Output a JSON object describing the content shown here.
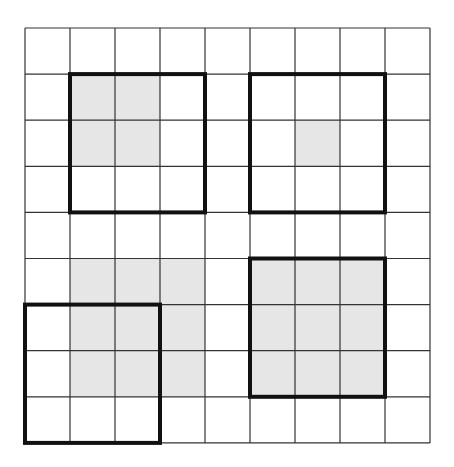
{
  "diagram": {
    "title": "",
    "grid": {
      "rows": 9,
      "cols": 9,
      "origin_x": 25,
      "origin_y": 28,
      "cell_w": 45,
      "cell_h": 46.1,
      "line_color": "#333333",
      "line_width": 1.2
    },
    "colors": {
      "background": "#ffffff",
      "shade": "#e6e6e6",
      "bold_border": "#111111"
    },
    "shaded_cells": [
      [
        1,
        1
      ],
      [
        1,
        2
      ],
      [
        2,
        1
      ],
      [
        2,
        2
      ],
      [
        2,
        6
      ],
      [
        5,
        1
      ],
      [
        5,
        2
      ],
      [
        5,
        3
      ],
      [
        6,
        1
      ],
      [
        6,
        2
      ],
      [
        6,
        3
      ],
      [
        7,
        1
      ],
      [
        7,
        2
      ],
      [
        7,
        3
      ],
      [
        5,
        5
      ],
      [
        5,
        6
      ],
      [
        5,
        7
      ],
      [
        6,
        5
      ],
      [
        6,
        6
      ],
      [
        6,
        7
      ],
      [
        7,
        5
      ],
      [
        7,
        6
      ],
      [
        7,
        7
      ]
    ],
    "bold_squares": [
      {
        "name": "top-left-square",
        "row": 1,
        "col": 1,
        "size": 3
      },
      {
        "name": "top-right-square",
        "row": 1,
        "col": 5,
        "size": 3
      },
      {
        "name": "bottom-left-square",
        "row": 6,
        "col": 0,
        "size": 3
      },
      {
        "name": "bottom-right-square",
        "row": 5,
        "col": 5,
        "size": 3
      }
    ]
  }
}
